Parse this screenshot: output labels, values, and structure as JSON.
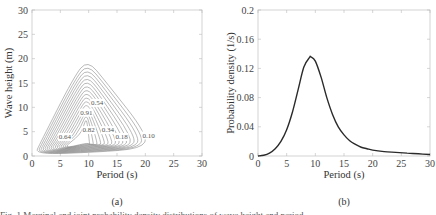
{
  "chart_data": [
    {
      "panel": "(a)",
      "type": "contour",
      "title": "",
      "xlabel": "Period (s)",
      "ylabel": "Wave height (m)",
      "xlim": [
        0,
        30
      ],
      "ylim": [
        0,
        30
      ],
      "xticks": [
        0,
        5,
        10,
        15,
        20,
        25,
        30
      ],
      "yticks": [
        0,
        5,
        10,
        15,
        20,
        25,
        30
      ],
      "grid": false,
      "contour_levels_labeled": [
        0.1,
        0.18,
        0.34,
        0.54,
        0.91,
        0.82,
        0.64
      ],
      "annotations": [
        {
          "text": "0.54",
          "x": 11.5,
          "y": 10.5
        },
        {
          "text": "0.91",
          "x": 9.6,
          "y": 8.5
        },
        {
          "text": "0.82",
          "x": 10.0,
          "y": 4.9
        },
        {
          "text": "0.34",
          "x": 13.4,
          "y": 4.9
        },
        {
          "text": "0.64",
          "x": 5.8,
          "y": 3.5
        },
        {
          "text": "0.18",
          "x": 15.8,
          "y": 3.5
        },
        {
          "text": "0.10",
          "x": 20.6,
          "y": 3.8
        }
      ],
      "peak_region": {
        "period": 9.5,
        "wave_height": 6.5
      },
      "outer_contour_extent": {
        "period_max": 20.5,
        "wave_height_max": 19.8
      }
    },
    {
      "panel": "(b)",
      "type": "line",
      "title": "",
      "xlabel": "Period (s)",
      "ylabel": "Probability density (1/s)",
      "xlim": [
        0,
        30
      ],
      "ylim": [
        0,
        0.2
      ],
      "xticks": [
        0,
        5,
        10,
        15,
        20,
        25,
        30
      ],
      "yticks": [
        0,
        0.04,
        0.08,
        0.12,
        0.16,
        0.2
      ],
      "grid": false,
      "series": [
        {
          "name": "marginal pdf of period",
          "x": [
            0,
            1,
            2,
            3,
            4,
            5,
            6,
            7,
            8,
            9,
            9.2,
            10,
            11,
            12,
            13,
            14,
            15,
            16,
            17,
            18,
            19,
            20,
            22,
            24,
            26,
            28,
            30
          ],
          "y": [
            0.0,
            0.001,
            0.004,
            0.01,
            0.02,
            0.036,
            0.06,
            0.091,
            0.122,
            0.135,
            0.136,
            0.13,
            0.108,
            0.08,
            0.057,
            0.04,
            0.029,
            0.021,
            0.016,
            0.012,
            0.01,
            0.008,
            0.006,
            0.005,
            0.004,
            0.003,
            0.002
          ]
        }
      ]
    }
  ],
  "figure": {
    "subcaption_a": "(a)",
    "subcaption_b": "(b)",
    "caption_partial": "Fig. 1 Marginal and joint probability density distributions of wave height and period"
  },
  "colors": {
    "contour": "#8a8a8a",
    "curve": "#2a2a2a",
    "axes": "#bdbdbd"
  }
}
